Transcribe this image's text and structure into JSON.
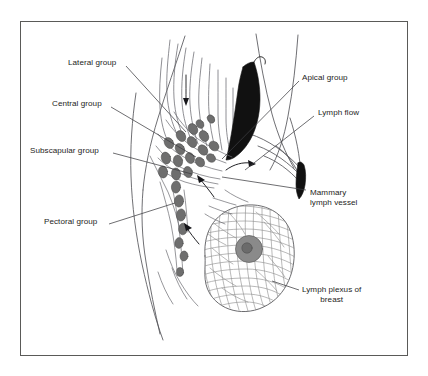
{
  "figure": {
    "border_color": "#5a5a58",
    "background_color": "#ffffff",
    "text_color": "#1d1d1b",
    "node_color": "#6e6e6e",
    "muscle_color": "#111111",
    "plexus_color": "#8d8d8d",
    "areola_color": "#8a8a8a"
  },
  "labels": [
    {
      "name": "lateral-group",
      "text": "Lateral group",
      "x": 68,
      "y": 64,
      "align": "left"
    },
    {
      "name": "central-group",
      "text": "Central group",
      "x": 52,
      "y": 104,
      "align": "left"
    },
    {
      "name": "subscapular-group",
      "text": "Subscapular group",
      "x": 30,
      "y": 151,
      "align": "left"
    },
    {
      "name": "pectoral-group",
      "text": "Pectoral group",
      "x": 44,
      "y": 222,
      "align": "left"
    },
    {
      "name": "apical-group",
      "text": "Apical group",
      "x": 302,
      "y": 78,
      "align": "left"
    },
    {
      "name": "lymph-flow",
      "text": "Lymph flow",
      "x": 318,
      "y": 113,
      "align": "left"
    }
  ],
  "labels_multiline": [
    {
      "name": "mammary-lymph-vessel",
      "lines": [
        "Mammary",
        "lymph vessel"
      ],
      "x": 310,
      "y": 193,
      "align": "left"
    },
    {
      "name": "lymph-plexus-of-breast",
      "lines": [
        "Lymph plexus of",
        "breast"
      ],
      "x": 302,
      "y": 290,
      "align": "left"
    }
  ],
  "anatomy": {
    "node_groups": [
      "Lateral group",
      "Central group",
      "Subscapular group",
      "Pectoral group",
      "Apical group"
    ],
    "structures": [
      "Mammary lymph vessel",
      "Lymph plexus of breast",
      "Pectoralis muscle",
      "Lymph flow arrows"
    ],
    "flow_arrow_count": 4
  }
}
